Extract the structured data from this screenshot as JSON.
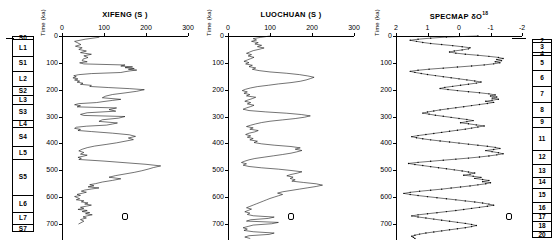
{
  "figure": {
    "y_axis_label": "Time (ka)",
    "y_ticks": [
      0,
      100,
      200,
      300,
      400,
      500,
      600,
      700
    ],
    "y_range": [
      0,
      760
    ]
  },
  "stratigraphy": {
    "name": "loess-paleosol-column",
    "units": [
      {
        "label": "S0",
        "top_ka": 0,
        "bottom_ka": 12
      },
      {
        "label": "L1",
        "top_ka": 12,
        "bottom_ka": 73
      },
      {
        "label": "S1",
        "top_ka": 73,
        "bottom_ka": 129
      },
      {
        "label": "L2",
        "top_ka": 129,
        "bottom_ka": 186
      },
      {
        "label": "S2",
        "top_ka": 186,
        "bottom_ka": 220
      },
      {
        "label": "L3",
        "top_ka": 220,
        "bottom_ka": 252
      },
      {
        "label": "S3",
        "top_ka": 252,
        "bottom_ka": 312
      },
      {
        "label": "L4",
        "top_ka": 312,
        "bottom_ka": 340
      },
      {
        "label": "S4",
        "top_ka": 340,
        "bottom_ka": 408
      },
      {
        "label": "L5",
        "top_ka": 408,
        "bottom_ka": 460
      },
      {
        "label": "S5",
        "top_ka": 460,
        "bottom_ka": 592
      },
      {
        "label": "L6",
        "top_ka": 592,
        "bottom_ka": 655
      },
      {
        "label": "L7",
        "top_ka": 655,
        "bottom_ka": 700
      },
      {
        "label": "S7",
        "top_ka": 700,
        "bottom_ka": 730
      }
    ]
  },
  "marine_isotope_stages": {
    "name": "marine-isotope-stage-column",
    "units": [
      {
        "label": "2",
        "top_ka": 12,
        "bottom_ka": 24
      },
      {
        "label": "3",
        "top_ka": 24,
        "bottom_ka": 59
      },
      {
        "label": "4",
        "top_ka": 59,
        "bottom_ka": 71
      },
      {
        "label": "5",
        "top_ka": 71,
        "bottom_ka": 128
      },
      {
        "label": "6",
        "top_ka": 128,
        "bottom_ka": 186
      },
      {
        "label": "7",
        "top_ka": 186,
        "bottom_ka": 245
      },
      {
        "label": "8",
        "top_ka": 245,
        "bottom_ka": 303
      },
      {
        "label": "9",
        "top_ka": 303,
        "bottom_ka": 339
      },
      {
        "label": "11",
        "top_ka": 339,
        "bottom_ka": 423
      },
      {
        "label": "12",
        "top_ka": 423,
        "bottom_ka": 478
      },
      {
        "label": "13",
        "top_ka": 478,
        "bottom_ka": 524
      },
      {
        "label": "14",
        "top_ka": 524,
        "bottom_ka": 565
      },
      {
        "label": "15",
        "top_ka": 565,
        "bottom_ka": 620
      },
      {
        "label": "16",
        "top_ka": 620,
        "bottom_ka": 659
      },
      {
        "label": "17",
        "top_ka": 659,
        "bottom_ka": 689
      },
      {
        "label": "18",
        "top_ka": 689,
        "bottom_ka": 726
      },
      {
        "label": "20",
        "top_ka": 726,
        "bottom_ka": 752
      }
    ]
  },
  "chart_data": [
    {
      "name": "xifeng-panel",
      "type": "line",
      "title": "XIFENG (S )",
      "xlabel": "",
      "ylabel": "Time (ka)",
      "xlim": [
        0,
        300
      ],
      "ylim": [
        760,
        0
      ],
      "x_ticks": [
        0,
        100,
        200,
        300
      ],
      "y_ticks": [
        0,
        100,
        200,
        300,
        400,
        500,
        600,
        700
      ],
      "grid": false,
      "legend": null,
      "marker_symbol": "open-rounded-square",
      "x": [
        88,
        55,
        30,
        38,
        45,
        32,
        48,
        40,
        58,
        44,
        70,
        52,
        62,
        50,
        48,
        60,
        42,
        52,
        150,
        140,
        168,
        150,
        172,
        158,
        178,
        162,
        150,
        140,
        70,
        40,
        28,
        34,
        26,
        38,
        30,
        42,
        36,
        50,
        44,
        70,
        66,
        110,
        160,
        196,
        178,
        150,
        120,
        104,
        96,
        140,
        120,
        100,
        82,
        40,
        30,
        44,
        36,
        130,
        112,
        128,
        60,
        44,
        52,
        150,
        135,
        96,
        88,
        132,
        120,
        106,
        58,
        34,
        30,
        44,
        38,
        70,
        120,
        160,
        175,
        158,
        170,
        150,
        130,
        105,
        78,
        60,
        48,
        40,
        52,
        44,
        60,
        50,
        38,
        46,
        40,
        100,
        150,
        200,
        235,
        218,
        205,
        190,
        172,
        150,
        128,
        112,
        140,
        120,
        96,
        80,
        66,
        76,
        62,
        88,
        70,
        54,
        46,
        58,
        48,
        36,
        44,
        30,
        36,
        42,
        34,
        52,
        46,
        62,
        54,
        70,
        58,
        44,
        52,
        38,
        60,
        48,
        66,
        56,
        72,
        60,
        50,
        58,
        44,
        52,
        40
      ],
      "y": [
        5,
        12,
        20,
        26,
        32,
        38,
        44,
        50,
        56,
        62,
        68,
        74,
        80,
        86,
        92,
        96,
        100,
        104,
        108,
        112,
        115,
        118,
        121,
        124,
        127,
        130,
        133,
        136,
        140,
        144,
        148,
        152,
        156,
        160,
        164,
        168,
        172,
        176,
        180,
        184,
        188,
        192,
        196,
        200,
        206,
        212,
        218,
        224,
        230,
        236,
        240,
        244,
        248,
        252,
        256,
        260,
        264,
        268,
        274,
        280,
        286,
        292,
        296,
        300,
        306,
        312,
        318,
        324,
        328,
        332,
        336,
        340,
        344,
        348,
        352,
        356,
        362,
        368,
        374,
        380,
        386,
        392,
        398,
        404,
        410,
        416,
        422,
        428,
        434,
        440,
        444,
        448,
        452,
        456,
        460,
        466,
        472,
        478,
        484,
        490,
        496,
        502,
        508,
        514,
        520,
        526,
        532,
        538,
        544,
        550,
        554,
        558,
        562,
        566,
        570,
        574,
        578,
        582,
        586,
        590,
        594,
        598,
        602,
        606,
        610,
        614,
        618,
        622,
        626,
        630,
        634,
        638,
        642,
        646,
        650,
        654,
        658,
        662,
        666,
        670,
        674,
        678,
        684,
        690,
        700,
        712
      ]
    },
    {
      "name": "luochuan-panel",
      "type": "line",
      "title": "LUOCHUAN (S )",
      "xlabel": "",
      "ylabel": "Time (ka)",
      "xlim": [
        0,
        300
      ],
      "ylim": [
        760,
        0
      ],
      "x_ticks": [
        0,
        100,
        200,
        300
      ],
      "y_ticks": [
        0,
        100,
        200,
        300,
        400,
        500,
        600,
        700
      ],
      "grid": false,
      "legend": null,
      "marker_symbol": "open-rounded-square",
      "x": [
        100,
        78,
        60,
        68,
        56,
        72,
        64,
        80,
        70,
        86,
        74,
        60,
        52,
        44,
        56,
        48,
        62,
        54,
        46,
        38,
        50,
        42,
        58,
        50,
        66,
        58,
        74,
        100,
        140,
        170,
        190,
        205,
        196,
        186,
        172,
        150,
        120,
        96,
        70,
        54,
        42,
        34,
        46,
        38,
        52,
        44,
        66,
        58,
        48,
        40,
        54,
        46,
        62,
        54,
        44,
        36,
        50,
        90,
        140,
        175,
        196,
        182,
        160,
        130,
        100,
        80,
        66,
        54,
        44,
        60,
        52,
        72,
        64,
        50,
        42,
        54,
        46,
        60,
        52,
        70,
        62,
        80,
        110,
        150,
        172,
        160,
        176,
        164,
        150,
        130,
        108,
        86,
        64,
        50,
        40,
        32,
        44,
        36,
        50,
        80,
        120,
        150,
        176,
        165,
        150,
        140,
        155,
        148,
        160,
        152,
        180,
        210,
        225,
        210,
        190,
        170,
        150,
        130,
        118,
        130,
        120,
        110,
        100,
        92,
        84,
        76,
        68,
        60,
        52,
        44,
        56,
        48,
        40,
        52,
        46,
        60,
        110,
        96,
        54,
        44,
        120,
        104,
        60,
        48,
        36,
        46,
        38,
        60,
        110,
        98,
        50,
        40,
        52
      ]
    },
    {
      "name": "specmap-panel",
      "type": "line",
      "title": "SPECMAP δO",
      "title_sup": "18",
      "xlabel": "",
      "ylabel": "Time (ka)",
      "xlim": [
        2,
        -2
      ],
      "ylim": [
        760,
        0
      ],
      "x_ticks": [
        2,
        1,
        0,
        -1,
        -2
      ],
      "y_ticks": [
        0,
        100,
        200,
        300,
        400,
        500,
        600,
        700
      ],
      "grid": false,
      "legend": null,
      "marker_symbol": "open-rounded-square",
      "x": [
        -0.6,
        0.4,
        0.9,
        1.3,
        1.55,
        1.35,
        1.15,
        0.9,
        0.55,
        0.2,
        -0.1,
        -0.35,
        -0.3,
        -0.1,
        0.15,
        0.3,
        0.1,
        -0.2,
        -0.6,
        -0.95,
        -1.25,
        -1.4,
        -1.2,
        -1.35,
        -1.15,
        -1.3,
        -1.1,
        -0.8,
        -0.4,
        0.05,
        0.5,
        0.95,
        1.3,
        1.55,
        1.4,
        1.2,
        1.0,
        0.75,
        0.5,
        0.25,
        0.0,
        -0.25,
        -0.5,
        -0.7,
        -0.55,
        -0.3,
        -0.05,
        0.2,
        0.45,
        0.6,
        0.35,
        0.05,
        -0.3,
        -0.65,
        -0.95,
        -1.15,
        -1.0,
        -1.2,
        -1.05,
        -1.25,
        -1.05,
        -0.85,
        -1.1,
        -0.9,
        -0.65,
        -0.4,
        -0.15,
        0.1,
        0.35,
        0.6,
        0.8,
        1.0,
        1.15,
        0.95,
        0.75,
        0.5,
        0.25,
        0.0,
        -0.25,
        -0.45,
        -0.25,
        -0.05,
        -0.3,
        -0.55,
        -0.8,
        -0.6,
        -0.4,
        -0.2,
        0.05,
        0.3,
        0.55,
        0.8,
        1.05,
        1.3,
        1.5,
        1.35,
        1.15,
        0.9,
        0.6,
        0.3,
        0.0,
        -0.3,
        -0.6,
        -0.9,
        -1.15,
        -1.3,
        -1.1,
        -0.85,
        -1.05,
        -1.25,
        -1.4,
        -1.2,
        -0.95,
        -0.65,
        -0.3,
        0.1,
        0.5,
        0.9,
        1.3,
        1.6,
        1.4,
        1.15,
        0.9,
        0.65,
        0.4,
        0.15,
        -0.1,
        -0.3,
        -0.5,
        -0.35,
        -0.15,
        -0.45,
        -0.7,
        -0.5,
        -0.75,
        -0.95,
        -0.75,
        -1.0,
        -0.85,
        -0.6,
        -0.35,
        -0.05,
        0.25,
        0.55,
        0.9,
        1.25,
        1.55,
        1.75,
        1.55,
        1.3,
        1.0,
        0.7,
        0.4,
        0.1,
        -0.2,
        -0.5,
        -0.75,
        -0.95,
        -1.1,
        -0.9,
        -0.65,
        -0.4,
        -0.15,
        0.1,
        0.4,
        0.7,
        1.0,
        1.3,
        1.5,
        1.3,
        1.05,
        0.8,
        0.55,
        0.3,
        0.05,
        -0.2,
        -0.4,
        -0.55,
        -0.4,
        -0.2,
        0.05,
        0.3,
        0.55,
        0.8,
        1.05,
        1.25,
        1.4,
        1.5,
        1.45,
        1.4
      ]
    }
  ]
}
